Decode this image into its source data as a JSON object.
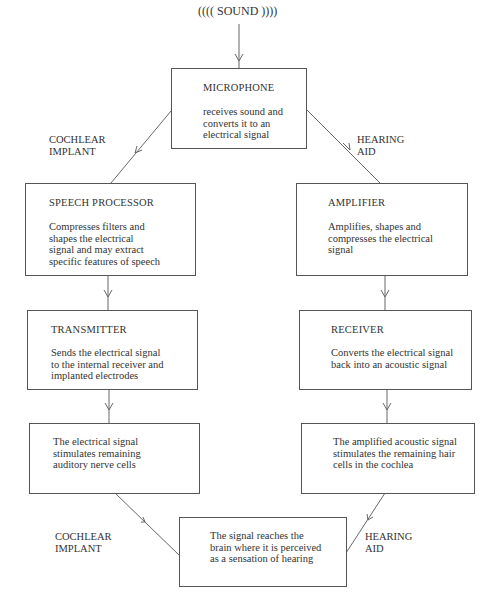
{
  "sound": {
    "label": "(((( SOUND ))))"
  },
  "side_labels": {
    "top_left": [
      "COCHLEAR",
      "IMPLANT"
    ],
    "top_right": [
      "HEARING",
      "AID"
    ],
    "bottom_left": [
      "COCHLEAR",
      "IMPLANT"
    ],
    "bottom_right": [
      "HEARING",
      "AID"
    ]
  },
  "boxes": {
    "microphone": {
      "title": "MICROPHONE",
      "lines": [
        "receives sound and",
        "converts it to an",
        "electrical signal"
      ]
    },
    "speech_processor": {
      "title": "SPEECH PROCESSOR",
      "lines": [
        "Compresses filters and",
        "shapes the electrical",
        "signal and may extract",
        "specific features of speech"
      ]
    },
    "amplifier": {
      "title": "AMPLIFIER",
      "lines": [
        "Amplifies, shapes and",
        "compresses the electrical",
        "signal"
      ]
    },
    "transmitter": {
      "title": "TRANSMITTER",
      "lines": [
        "Sends the electrical signal",
        "to the internal receiver and",
        "implanted electrodes"
      ]
    },
    "receiver": {
      "title": "RECEIVER",
      "lines": [
        "Converts the electrical signal",
        "back into an acoustic signal"
      ]
    },
    "nerve_stimulation": {
      "lines": [
        "The electrical signal",
        "stimulates remaining",
        "auditory nerve cells"
      ]
    },
    "hair_cell_stimulation": {
      "lines": [
        "The amplified acoustic signal",
        "stimulates the remaining hair",
        "cells in the cochlea"
      ]
    },
    "brain": {
      "lines": [
        "The signal reaches the",
        "brain where it is perceived",
        "as a sensation of hearing"
      ]
    }
  }
}
